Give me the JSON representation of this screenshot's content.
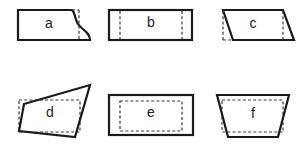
{
  "diagram": {
    "shapes": [
      {
        "id": "a",
        "label": "a",
        "outline": "rectangle-with-curved-right-edge",
        "dashed": "vertical-line-right"
      },
      {
        "id": "b",
        "label": "b",
        "outline": "rectangle",
        "dashed": "two-vertical-lines"
      },
      {
        "id": "c",
        "label": "c",
        "outline": "parallelogram",
        "dashed": "two-vertical-lines"
      },
      {
        "id": "d",
        "label": "d",
        "outline": "irregular-quadrilateral",
        "dashed": "inner-rectangle"
      },
      {
        "id": "e",
        "label": "e",
        "outline": "rectangle",
        "dashed": "inner-rectangle"
      },
      {
        "id": "f",
        "label": "f",
        "outline": "trapezoid",
        "dashed": "inner-rectangle"
      }
    ],
    "colors": {
      "stroke": "#1a1a1a",
      "background": "#ffffff"
    }
  }
}
